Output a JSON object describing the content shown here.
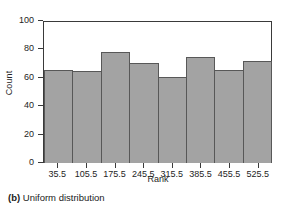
{
  "caption": {
    "label": "(b)",
    "text": "Uniform distribution"
  },
  "colors": {
    "bar_fill": "#a3a3a3",
    "bar_edge": "#585858",
    "axis": "#3a3a3a",
    "text": "#1a1a1a",
    "background": "#ffffff"
  },
  "chart_data": {
    "type": "bar",
    "title": "",
    "subtitle": "",
    "xlabel": "Rank",
    "ylabel": "Count",
    "categories": [
      "35.5",
      "105.5",
      "175.5",
      "245.5",
      "315.5",
      "385.5",
      "455.5",
      "525.5"
    ],
    "values": [
      66,
      65,
      79,
      71,
      61,
      75,
      66,
      72
    ],
    "xtick_labels": [
      "35.5",
      "105.5",
      "175.5",
      "245.5",
      "315.5",
      "385.5",
      "455.5",
      "525.5"
    ],
    "ytick_labels": [
      "0",
      "20",
      "40",
      "60",
      "80",
      "100"
    ],
    "ytick_values": [
      0,
      20,
      40,
      60,
      80,
      100
    ],
    "ylim": [
      0,
      100
    ],
    "grid": false,
    "legend": null,
    "bar_gap": 0,
    "annotations": []
  }
}
